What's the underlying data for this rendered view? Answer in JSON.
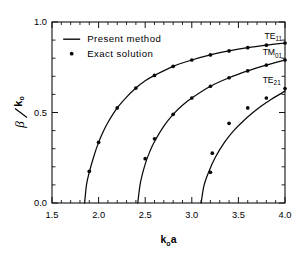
{
  "figure": {
    "background_color": "#ffffff",
    "ink_color": "#0a0a0a"
  },
  "legend": {
    "position": "upper-left-inside",
    "entries": [
      {
        "marker": "line",
        "label": "Present method"
      },
      {
        "marker": "dot",
        "label": "Exact solution"
      }
    ]
  },
  "axes": {
    "x": {
      "label_main": "k",
      "label_sub": "o",
      "label_tail": "a",
      "ticks": [
        "1.5",
        "2.0",
        "2.5",
        "3.0",
        "3.5",
        "4.0"
      ],
      "tick_values": [
        1.5,
        2.0,
        2.5,
        3.0,
        3.5,
        4.0
      ],
      "minor_per_interval": 5,
      "range": [
        1.5,
        4.0
      ]
    },
    "y": {
      "label_main": "β",
      "label_div": "/",
      "label_den": "k",
      "label_den_sub": "o",
      "ticks": [
        "0.0",
        "0.5",
        "1.0"
      ],
      "tick_values": [
        0.0,
        0.5,
        1.0
      ],
      "minor_per_interval": 5,
      "range": [
        0.0,
        1.0
      ]
    }
  },
  "annotations": [
    {
      "name": "te11-label",
      "main": "TE",
      "sub": "11",
      "x": 3.78,
      "y": 0.905
    },
    {
      "name": "tm01-label",
      "main": "TM",
      "sub": "01",
      "x": 3.76,
      "y": 0.815
    },
    {
      "name": "te21-label",
      "main": "TE",
      "sub": "21",
      "x": 3.76,
      "y": 0.665
    }
  ],
  "chart_data": {
    "type": "line",
    "title": "",
    "xlabel": "k₀a",
    "ylabel": "β/k₀",
    "xlim": [
      1.5,
      4.0
    ],
    "ylim": [
      0.0,
      1.0
    ],
    "grid": false,
    "legend_position": "upper left",
    "series": [
      {
        "name": "TE11",
        "kind": "present method (line)",
        "cutoff": 1.85,
        "x": [
          1.85,
          1.87,
          1.9,
          1.95,
          2.0,
          2.05,
          2.1,
          2.2,
          2.3,
          2.4,
          2.5,
          2.6,
          2.8,
          3.0,
          3.2,
          3.4,
          3.6,
          3.8,
          4.0
        ],
        "y": [
          0.0,
          0.1,
          0.17,
          0.26,
          0.335,
          0.395,
          0.445,
          0.525,
          0.585,
          0.635,
          0.675,
          0.705,
          0.755,
          0.79,
          0.818,
          0.84,
          0.858,
          0.872,
          0.884
        ]
      },
      {
        "name": "TE11-exact",
        "kind": "exact solution (dots)",
        "x": [
          1.9,
          2.0,
          2.2,
          2.4,
          2.6,
          2.8,
          3.0,
          3.2,
          3.4,
          3.6,
          3.8,
          4.0
        ],
        "y": [
          0.175,
          0.335,
          0.525,
          0.635,
          0.705,
          0.755,
          0.79,
          0.818,
          0.84,
          0.858,
          0.872,
          0.884
        ]
      },
      {
        "name": "TM01",
        "kind": "present method (line)",
        "cutoff": 2.42,
        "x": [
          2.42,
          2.45,
          2.5,
          2.55,
          2.6,
          2.7,
          2.8,
          2.9,
          3.0,
          3.2,
          3.4,
          3.6,
          3.8,
          4.0
        ],
        "y": [
          0.0,
          0.115,
          0.215,
          0.285,
          0.34,
          0.425,
          0.49,
          0.54,
          0.58,
          0.645,
          0.692,
          0.73,
          0.762,
          0.79
        ]
      },
      {
        "name": "TM01-exact",
        "kind": "exact solution (dots)",
        "x": [
          2.5,
          2.6,
          2.8,
          3.0,
          3.2,
          3.4,
          3.6,
          3.8,
          4.0
        ],
        "y": [
          0.245,
          0.355,
          0.49,
          0.58,
          0.645,
          0.692,
          0.73,
          0.762,
          0.79
        ]
      },
      {
        "name": "TE21",
        "kind": "present method (line)",
        "cutoff": 3.1,
        "x": [
          3.1,
          3.13,
          3.18,
          3.25,
          3.35,
          3.45,
          3.55,
          3.65,
          3.75,
          3.85,
          4.0
        ],
        "y": [
          0.0,
          0.095,
          0.17,
          0.25,
          0.335,
          0.4,
          0.452,
          0.497,
          0.537,
          0.572,
          0.618
        ]
      },
      {
        "name": "TE21-exact",
        "kind": "exact solution (dots)",
        "x": [
          3.2,
          3.22,
          3.4,
          3.6,
          3.8,
          4.0
        ],
        "y": [
          0.17,
          0.275,
          0.44,
          0.525,
          0.58,
          0.632
        ]
      }
    ]
  }
}
